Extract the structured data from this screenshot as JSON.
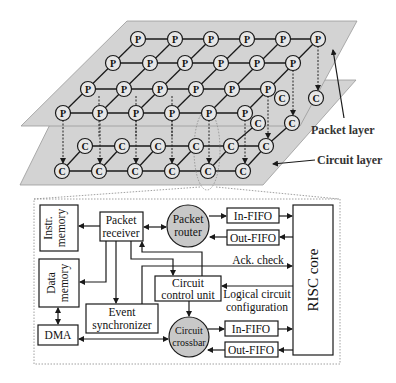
{
  "figure": {
    "layers": {
      "packet_layer_label": "Packet layer",
      "circuit_layer_label": "Circuit layer",
      "packet_node_glyph": "P",
      "circuit_node_glyph": "C"
    },
    "blocks": {
      "instr_memory": [
        "Instr.",
        "memory"
      ],
      "data_memory": [
        "Data",
        "memory"
      ],
      "dma": "DMA",
      "packet_receiver": [
        "Packet",
        "receiver"
      ],
      "packet_router": [
        "Packet",
        "router"
      ],
      "event_synchronizer": [
        "Event",
        "synchronizer"
      ],
      "circuit_control_unit": [
        "Circuit",
        "control unit"
      ],
      "circuit_crossbar": [
        "Circuit",
        "crossbar"
      ],
      "in_fifo_top": "In-FIFO",
      "out_fifo_top": "Out-FIFO",
      "in_fifo_bottom": "In-FIFO",
      "out_fifo_bottom": "Out-FIFO",
      "risc_core": "RISC core"
    },
    "signals": {
      "ack_check": "Ack. check",
      "logical_circuit_configuration": [
        "Logical circuit",
        "configuration"
      ]
    },
    "colors": {
      "plane_fill": "#d3d3d3",
      "router_fill": "#c8c8c8",
      "line": "#1a1a1a"
    }
  }
}
